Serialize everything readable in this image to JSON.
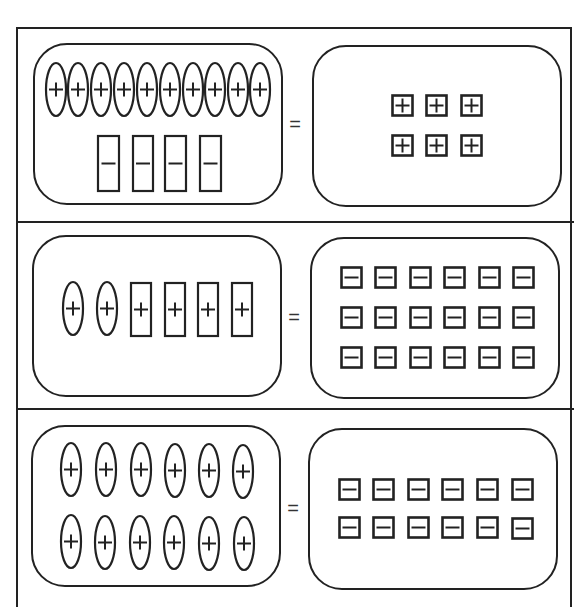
{
  "colors": {
    "stroke": "#222222",
    "background": "#ffffff"
  },
  "equals_symbol": "=",
  "tile_types": {
    "positive_unit_square": "small square with plus sign",
    "negative_unit_square": "small square with minus sign",
    "positive_x_ellipse": "tall ellipse with plus sign",
    "positive_rect": "tall rectangle with plus sign",
    "negative_rect": "tall rectangle with minus sign"
  },
  "rows": [
    {
      "id": "row-1",
      "left": {
        "description": "10 positive ellipses and 4 negative rectangles",
        "tiles": [
          {
            "shape": "ellipse",
            "sign": "+",
            "x": 45,
            "y": 62,
            "w": 22,
            "h": 55
          },
          {
            "shape": "ellipse",
            "sign": "+",
            "x": 67,
            "y": 62,
            "w": 22,
            "h": 55
          },
          {
            "shape": "ellipse",
            "sign": "+",
            "x": 90,
            "y": 62,
            "w": 22,
            "h": 55
          },
          {
            "shape": "ellipse",
            "sign": "+",
            "x": 113,
            "y": 62,
            "w": 22,
            "h": 55
          },
          {
            "shape": "ellipse",
            "sign": "+",
            "x": 136,
            "y": 62,
            "w": 22,
            "h": 55
          },
          {
            "shape": "ellipse",
            "sign": "+",
            "x": 159,
            "y": 62,
            "w": 22,
            "h": 55
          },
          {
            "shape": "ellipse",
            "sign": "+",
            "x": 182,
            "y": 62,
            "w": 22,
            "h": 55
          },
          {
            "shape": "ellipse",
            "sign": "+",
            "x": 204,
            "y": 62,
            "w": 22,
            "h": 55
          },
          {
            "shape": "ellipse",
            "sign": "+",
            "x": 227,
            "y": 62,
            "w": 22,
            "h": 55
          },
          {
            "shape": "ellipse",
            "sign": "+",
            "x": 249,
            "y": 62,
            "w": 22,
            "h": 55
          },
          {
            "shape": "rect",
            "sign": "-",
            "x": 97,
            "y": 135,
            "w": 23,
            "h": 57
          },
          {
            "shape": "rect",
            "sign": "-",
            "x": 132,
            "y": 135,
            "w": 22,
            "h": 57
          },
          {
            "shape": "rect",
            "sign": "-",
            "x": 164,
            "y": 135,
            "w": 23,
            "h": 57
          },
          {
            "shape": "rect",
            "sign": "-",
            "x": 199,
            "y": 135,
            "w": 23,
            "h": 57
          }
        ]
      },
      "right": {
        "description": "6 positive unit squares",
        "tiles": [
          {
            "shape": "square",
            "sign": "+",
            "x": 391,
            "y": 94,
            "w": 23,
            "h": 23
          },
          {
            "shape": "square",
            "sign": "+",
            "x": 425,
            "y": 94,
            "w": 23,
            "h": 23
          },
          {
            "shape": "square",
            "sign": "+",
            "x": 460,
            "y": 94,
            "w": 23,
            "h": 23
          },
          {
            "shape": "square",
            "sign": "+",
            "x": 391,
            "y": 134,
            "w": 23,
            "h": 23
          },
          {
            "shape": "square",
            "sign": "+",
            "x": 425,
            "y": 134,
            "w": 23,
            "h": 23
          },
          {
            "shape": "square",
            "sign": "+",
            "x": 460,
            "y": 134,
            "w": 23,
            "h": 23
          }
        ]
      }
    },
    {
      "id": "row-2",
      "left": {
        "description": "2 positive ellipses and 4 positive rectangles",
        "tiles": [
          {
            "shape": "ellipse",
            "sign": "+",
            "x": 62,
            "y": 281,
            "w": 22,
            "h": 55
          },
          {
            "shape": "ellipse",
            "sign": "+",
            "x": 96,
            "y": 281,
            "w": 22,
            "h": 55
          },
          {
            "shape": "rect",
            "sign": "+",
            "x": 130,
            "y": 282,
            "w": 22,
            "h": 55
          },
          {
            "shape": "rect",
            "sign": "+",
            "x": 164,
            "y": 282,
            "w": 22,
            "h": 55
          },
          {
            "shape": "rect",
            "sign": "+",
            "x": 197,
            "y": 282,
            "w": 22,
            "h": 55
          },
          {
            "shape": "rect",
            "sign": "+",
            "x": 231,
            "y": 282,
            "w": 22,
            "h": 55
          }
        ]
      },
      "right": {
        "description": "18 negative unit squares",
        "tiles": [
          {
            "shape": "square",
            "sign": "-",
            "x": 340,
            "y": 266,
            "w": 23,
            "h": 23
          },
          {
            "shape": "square",
            "sign": "-",
            "x": 374,
            "y": 266,
            "w": 23,
            "h": 23
          },
          {
            "shape": "square",
            "sign": "-",
            "x": 409,
            "y": 266,
            "w": 23,
            "h": 23
          },
          {
            "shape": "square",
            "sign": "-",
            "x": 443,
            "y": 266,
            "w": 23,
            "h": 23
          },
          {
            "shape": "square",
            "sign": "-",
            "x": 478,
            "y": 266,
            "w": 23,
            "h": 23
          },
          {
            "shape": "square",
            "sign": "-",
            "x": 512,
            "y": 266,
            "w": 23,
            "h": 23
          },
          {
            "shape": "square",
            "sign": "-",
            "x": 340,
            "y": 306,
            "w": 23,
            "h": 23
          },
          {
            "shape": "square",
            "sign": "-",
            "x": 374,
            "y": 306,
            "w": 23,
            "h": 23
          },
          {
            "shape": "square",
            "sign": "-",
            "x": 409,
            "y": 306,
            "w": 23,
            "h": 23
          },
          {
            "shape": "square",
            "sign": "-",
            "x": 443,
            "y": 306,
            "w": 23,
            "h": 23
          },
          {
            "shape": "square",
            "sign": "-",
            "x": 478,
            "y": 306,
            "w": 23,
            "h": 23
          },
          {
            "shape": "square",
            "sign": "-",
            "x": 512,
            "y": 306,
            "w": 23,
            "h": 23
          },
          {
            "shape": "square",
            "sign": "-",
            "x": 340,
            "y": 346,
            "w": 23,
            "h": 23
          },
          {
            "shape": "square",
            "sign": "-",
            "x": 374,
            "y": 346,
            "w": 23,
            "h": 23
          },
          {
            "shape": "square",
            "sign": "-",
            "x": 409,
            "y": 346,
            "w": 23,
            "h": 23
          },
          {
            "shape": "square",
            "sign": "-",
            "x": 443,
            "y": 346,
            "w": 23,
            "h": 23
          },
          {
            "shape": "square",
            "sign": "-",
            "x": 478,
            "y": 346,
            "w": 23,
            "h": 23
          },
          {
            "shape": "square",
            "sign": "-",
            "x": 512,
            "y": 346,
            "w": 23,
            "h": 23
          }
        ]
      }
    },
    {
      "id": "row-3",
      "left": {
        "description": "12 positive ellipses",
        "tiles": [
          {
            "shape": "ellipse",
            "sign": "+",
            "x": 60,
            "y": 442,
            "w": 22,
            "h": 55
          },
          {
            "shape": "ellipse",
            "sign": "+",
            "x": 95,
            "y": 442,
            "w": 22,
            "h": 55
          },
          {
            "shape": "ellipse",
            "sign": "+",
            "x": 130,
            "y": 442,
            "w": 22,
            "h": 55
          },
          {
            "shape": "ellipse",
            "sign": "+",
            "x": 164,
            "y": 443,
            "w": 22,
            "h": 55
          },
          {
            "shape": "ellipse",
            "sign": "+",
            "x": 198,
            "y": 443,
            "w": 22,
            "h": 55
          },
          {
            "shape": "ellipse",
            "sign": "+",
            "x": 232,
            "y": 444,
            "w": 22,
            "h": 55
          },
          {
            "shape": "ellipse",
            "sign": "+",
            "x": 60,
            "y": 514,
            "w": 22,
            "h": 55
          },
          {
            "shape": "ellipse",
            "sign": "+",
            "x": 94,
            "y": 515,
            "w": 22,
            "h": 55
          },
          {
            "shape": "ellipse",
            "sign": "+",
            "x": 129,
            "y": 515,
            "w": 22,
            "h": 55
          },
          {
            "shape": "ellipse",
            "sign": "+",
            "x": 163,
            "y": 515,
            "w": 22,
            "h": 55
          },
          {
            "shape": "ellipse",
            "sign": "+",
            "x": 198,
            "y": 516,
            "w": 22,
            "h": 55
          },
          {
            "shape": "ellipse",
            "sign": "+",
            "x": 233,
            "y": 516,
            "w": 22,
            "h": 55
          }
        ]
      },
      "right": {
        "description": "12 negative unit squares",
        "tiles": [
          {
            "shape": "square",
            "sign": "-",
            "x": 338,
            "y": 478,
            "w": 23,
            "h": 23
          },
          {
            "shape": "square",
            "sign": "-",
            "x": 372,
            "y": 478,
            "w": 23,
            "h": 23
          },
          {
            "shape": "square",
            "sign": "-",
            "x": 407,
            "y": 478,
            "w": 23,
            "h": 23
          },
          {
            "shape": "square",
            "sign": "-",
            "x": 441,
            "y": 478,
            "w": 23,
            "h": 23
          },
          {
            "shape": "square",
            "sign": "-",
            "x": 476,
            "y": 478,
            "w": 23,
            "h": 23
          },
          {
            "shape": "square",
            "sign": "-",
            "x": 511,
            "y": 478,
            "w": 23,
            "h": 23
          },
          {
            "shape": "square",
            "sign": "-",
            "x": 338,
            "y": 516,
            "w": 23,
            "h": 23
          },
          {
            "shape": "square",
            "sign": "-",
            "x": 372,
            "y": 516,
            "w": 23,
            "h": 23
          },
          {
            "shape": "square",
            "sign": "-",
            "x": 407,
            "y": 516,
            "w": 23,
            "h": 23
          },
          {
            "shape": "square",
            "sign": "-",
            "x": 441,
            "y": 516,
            "w": 23,
            "h": 23
          },
          {
            "shape": "square",
            "sign": "-",
            "x": 476,
            "y": 516,
            "w": 23,
            "h": 23
          },
          {
            "shape": "square",
            "sign": "-",
            "x": 511,
            "y": 517,
            "w": 23,
            "h": 23
          }
        ]
      }
    }
  ]
}
